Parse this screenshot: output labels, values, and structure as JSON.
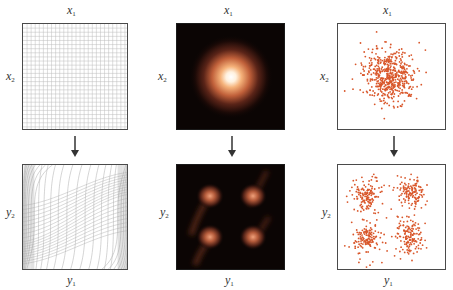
{
  "figure": {
    "columns": [
      {
        "id": "grid",
        "top": {
          "x_label_var": "x",
          "x_label_sub": "1",
          "y_label_var": "x",
          "y_label_sub": "2",
          "content": "uniform square grid"
        },
        "bottom": {
          "x_label_var": "y",
          "x_label_sub": "1",
          "y_label_var": "y",
          "y_label_sub": "2",
          "content": "warped grid (sigmoid-shaped curves, dense at left and right edges)"
        }
      },
      {
        "id": "density",
        "top": {
          "x_label_var": "x",
          "x_label_sub": "1",
          "y_label_var": "x",
          "y_label_sub": "2",
          "content": "isotropic Gaussian density heatmap on black"
        },
        "bottom": {
          "x_label_var": "y",
          "x_label_sub": "1",
          "y_label_var": "y",
          "y_label_sub": "2",
          "content": "transformed density with four modes on black"
        }
      },
      {
        "id": "samples",
        "top": {
          "x_label_var": "x",
          "x_label_sub": "1",
          "y_label_var": "x",
          "y_label_sub": "2",
          "content": "scatter of Gaussian samples"
        },
        "bottom": {
          "x_label_var": "y",
          "x_label_sub": "1",
          "y_label_var": "y",
          "y_label_sub": "2",
          "content": "scatter of transformed samples, four clusters"
        }
      }
    ],
    "arrow_icon": "down-arrow",
    "colors": {
      "frame": "#4a4a4a",
      "grid_line": "#bdbdbd",
      "density_bg": "#0b0504",
      "density_glow": "#e07a4a",
      "density_core": "#fff4e8",
      "sample_dot": "#d9572b"
    }
  }
}
